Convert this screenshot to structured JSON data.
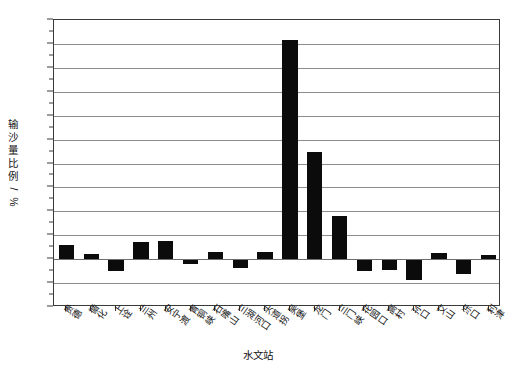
{
  "chart_data": {
    "type": "bar",
    "title": "",
    "subtitle": "",
    "xlabel": "水文站",
    "ylabel": "输沙量比例/%",
    "ylim": [
      -10,
      50
    ],
    "ytick_step": 5,
    "yticks": [
      50,
      45,
      40,
      35,
      30,
      25,
      20,
      15,
      10,
      5,
      0,
      -5,
      -10
    ],
    "ytick_labels": [
      "50",
      "45",
      "40",
      "35",
      "30",
      "25",
      "20",
      "15",
      "10",
      "5",
      "0",
      "-5",
      "-10"
    ],
    "grid": true,
    "grid_axis": "y",
    "legend": "none",
    "bar_color": "#0b0b0b",
    "categories": [
      "贵德",
      "循化",
      "上诠",
      "兰州",
      "安宁渡",
      "青铜峡",
      "石嘴山",
      "三湖河口",
      "头道拐",
      "吴堡",
      "龙门",
      "三门峡",
      "花园口",
      "高村",
      "孙口",
      "艾山",
      "泺口",
      "利津"
    ],
    "values": [
      3.0,
      1.0,
      -2.5,
      3.5,
      3.7,
      -1.0,
      1.5,
      -1.8,
      1.4,
      45.8,
      22.3,
      9.0,
      -2.5,
      -2.3,
      -4.3,
      1.2,
      -3.2,
      0.8
    ]
  }
}
